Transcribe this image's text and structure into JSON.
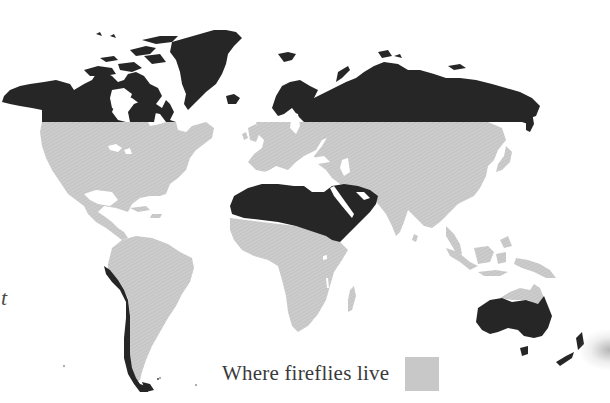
{
  "figure": {
    "type": "world-map",
    "legend": {
      "label": "Where fireflies live",
      "swatch_color": "#c8c8c8"
    },
    "edge_fragment_text": "t",
    "colors": {
      "habitat_land": "#c8c8c8",
      "non_habitat_land": "#262626",
      "water_background": "#ffffff",
      "legend_text": "#3a3a3a"
    },
    "regions": {
      "habitat": [
        "North America (south of ~55°N)",
        "Central America and Caribbean",
        "South America (east of the Andes)",
        "Europe",
        "Sub-Saharan Africa",
        "Madagascar",
        "Central and South Asia",
        "East Asia and Japan",
        "Southeast Asia and Indonesia",
        "New Guinea",
        "Northern coastal strip of Australia"
      ],
      "non_habitat": [
        "Alaska and northern Canada",
        "Canadian Arctic Archipelago",
        "Greenland",
        "Iceland",
        "Northern Scandinavia and northern Russia/Siberia",
        "Sahara / North Africa",
        "Arabian Peninsula and Middle East",
        "Western coast of South America (Andes/Atacama)",
        "Tierra del Fuego",
        "Australia (interior and south)",
        "Tasmania",
        "New Zealand"
      ]
    }
  }
}
